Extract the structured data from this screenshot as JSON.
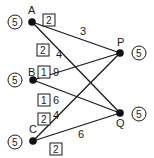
{
  "diagram": {
    "nodes": [
      {
        "id": "A",
        "label": "A",
        "capacity": "5",
        "side": "left"
      },
      {
        "id": "B",
        "label": "B",
        "capacity": "5",
        "side": "left"
      },
      {
        "id": "C",
        "label": "C",
        "capacity": "5",
        "side": "left"
      },
      {
        "id": "P",
        "label": "P",
        "capacity": "5",
        "side": "right"
      },
      {
        "id": "Q",
        "label": "Q",
        "capacity": "5",
        "side": "right"
      }
    ],
    "edges": [
      {
        "from": "A",
        "to": "P",
        "weight": "3"
      },
      {
        "from": "A",
        "to": "Q",
        "weight": "4"
      },
      {
        "from": "B",
        "to": "P",
        "weight": "9"
      },
      {
        "from": "B",
        "to": "Q",
        "weight": "6"
      },
      {
        "from": "C",
        "to": "P",
        "weight": "4"
      },
      {
        "from": "C",
        "to": "Q",
        "weight": "6"
      }
    ],
    "boxed_labels": [
      {
        "near": "A",
        "value": "2"
      },
      {
        "near": "A-Q",
        "value": "2"
      },
      {
        "near": "B-P",
        "value": "1"
      },
      {
        "near": "B-Q",
        "value": "1"
      },
      {
        "near": "C-P",
        "value": "2"
      },
      {
        "near": "C-Q",
        "value": "2"
      }
    ]
  }
}
